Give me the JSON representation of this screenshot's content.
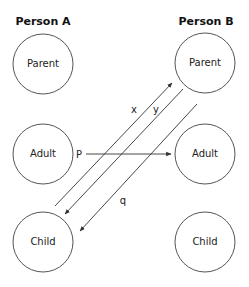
{
  "columns": [
    {
      "id": "A",
      "header": "Person A",
      "states": [
        "Parent",
        "Adult",
        "Child"
      ]
    },
    {
      "id": "B",
      "header": "Person B",
      "states": [
        "Parent",
        "Adult",
        "Child"
      ]
    }
  ],
  "transactions": [
    {
      "label": "x",
      "from": "A.Child",
      "to": "B.Parent"
    },
    {
      "label": "y",
      "from": "B.Parent",
      "to": "A.Child"
    },
    {
      "label": "P",
      "from": "A.Adult",
      "to": "B.Adult"
    },
    {
      "label": "q",
      "from": "B.Parent",
      "to": "A.Child"
    }
  ],
  "colors": {
    "stroke": "#333333",
    "text": "#222222",
    "background": "#ffffff"
  }
}
